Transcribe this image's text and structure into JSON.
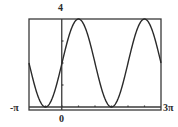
{
  "chart_data": {
    "type": "line",
    "title": "",
    "function": "y = 2 + 2 sin(x)",
    "xlabel": "",
    "ylabel": "",
    "xlim": [
      -3.14159,
      9.42478
    ],
    "ylim": [
      0,
      4
    ],
    "x_tick_labels": [
      "-π",
      "0",
      "3π"
    ],
    "y_tick_labels": [
      "4"
    ],
    "x_tick_step": "π/2",
    "y_tick_step": 1,
    "grid": false,
    "legend": null,
    "series": [
      {
        "name": "y = 2 + 2sin(x)",
        "x": [
          "-π",
          "-π/2",
          "0",
          "π/2",
          "π",
          "3π/2",
          "2π",
          "5π/2",
          "3π"
        ],
        "x_numeric": [
          -3.1416,
          -1.5708,
          0,
          1.5708,
          3.1416,
          4.7124,
          6.2832,
          7.854,
          9.4248
        ],
        "values": [
          2,
          0,
          2,
          4,
          2,
          0,
          2,
          4,
          2
        ]
      }
    ]
  },
  "labels": {
    "ymax": "4",
    "xmin": "-π",
    "xzero": "0",
    "xmax": "3π"
  },
  "colors": {
    "curve": "#2b2b2b",
    "frame": "#3a3a3a",
    "background": "#ffffff"
  }
}
